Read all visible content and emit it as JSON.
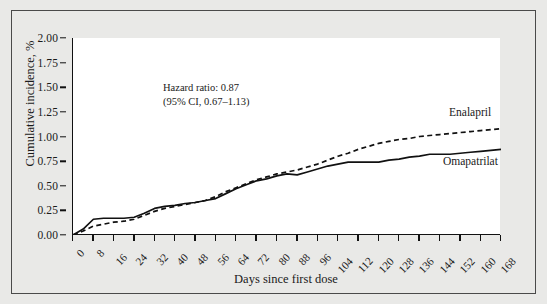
{
  "chart_data": {
    "type": "line",
    "title": "",
    "subtitle": "",
    "xlabel": "Days since first dose",
    "ylabel": "Cumulative incidence, %",
    "xlim": [
      0,
      168
    ],
    "ylim": [
      0,
      2.0
    ],
    "grid": false,
    "legend_position": "inline-right",
    "x_ticks": [
      0,
      8,
      16,
      24,
      32,
      40,
      48,
      56,
      64,
      72,
      80,
      88,
      96,
      104,
      112,
      120,
      128,
      136,
      144,
      152,
      160,
      168
    ],
    "y_ticks": [
      0.0,
      0.25,
      0.5,
      0.75,
      1.0,
      1.25,
      1.5,
      1.75,
      2.0
    ],
    "y_tick_labels": [
      "0.00",
      "0.25",
      "0.50",
      "0.75",
      "1.00",
      "1.25",
      "1.50",
      "1.75",
      "2.00"
    ],
    "x": [
      0,
      4,
      8,
      12,
      16,
      20,
      24,
      28,
      32,
      36,
      40,
      44,
      48,
      52,
      56,
      60,
      64,
      68,
      72,
      76,
      80,
      84,
      88,
      92,
      96,
      100,
      104,
      108,
      112,
      116,
      120,
      124,
      128,
      132,
      136,
      140,
      144,
      148,
      152,
      156,
      160,
      164,
      168
    ],
    "series": [
      {
        "name": "Enalapril",
        "style": "dashed",
        "color": "#111111",
        "values": [
          0.0,
          0.04,
          0.09,
          0.11,
          0.13,
          0.14,
          0.16,
          0.2,
          0.24,
          0.27,
          0.29,
          0.31,
          0.33,
          0.35,
          0.39,
          0.44,
          0.48,
          0.52,
          0.56,
          0.59,
          0.62,
          0.64,
          0.66,
          0.69,
          0.72,
          0.76,
          0.8,
          0.83,
          0.87,
          0.9,
          0.93,
          0.95,
          0.97,
          0.98,
          1.0,
          1.01,
          1.02,
          1.03,
          1.04,
          1.05,
          1.06,
          1.07,
          1.08
        ]
      },
      {
        "name": "Omapatrilat",
        "style": "solid",
        "color": "#111111",
        "values": [
          0.0,
          0.06,
          0.16,
          0.17,
          0.17,
          0.17,
          0.18,
          0.22,
          0.27,
          0.29,
          0.3,
          0.32,
          0.33,
          0.35,
          0.37,
          0.42,
          0.47,
          0.51,
          0.55,
          0.57,
          0.6,
          0.62,
          0.61,
          0.64,
          0.67,
          0.7,
          0.72,
          0.74,
          0.74,
          0.74,
          0.74,
          0.76,
          0.77,
          0.79,
          0.8,
          0.82,
          0.82,
          0.82,
          0.83,
          0.84,
          0.85,
          0.86,
          0.87
        ]
      }
    ],
    "annotations": [
      "Hazard ratio: 0.87",
      "(95% CI, 0.67–1.13)"
    ]
  },
  "annotation": {
    "line1": "Hazard ratio: 0.87",
    "line2": "(95% CI, 0.67–1.13)"
  },
  "labels": {
    "enalapril": "Enalapril",
    "omapatrilat": "Omapatrilat"
  }
}
